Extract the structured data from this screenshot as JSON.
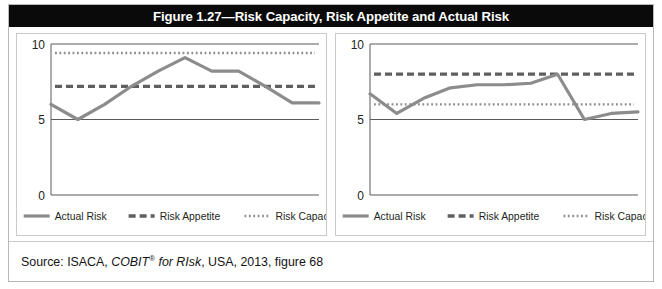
{
  "figure": {
    "title": "Figure 1.27—Risk Capacity, Risk Appetite and Actual Risk",
    "source_prefix": "Source: ISACA, ",
    "source_italic": "COBIT",
    "source_italic_sup": "®",
    "source_italic_tail": " for RIsk",
    "source_suffix": ", USA, 2013, figure 68"
  },
  "style": {
    "title_bg": "#0a0a0a",
    "title_fg": "#ffffff",
    "series_color": "#8c8c8c",
    "axis_color": "#5a5a5a",
    "frame_color": "#c9c9c9",
    "page_bg": "#ffffff"
  },
  "legend": {
    "items": [
      {
        "label": "Actual Risk",
        "style": "solid",
        "color": "#8c8c8c"
      },
      {
        "label": "Risk Appetite",
        "style": "dashed",
        "color": "#5f5f5f"
      },
      {
        "label": "Risk Capacity",
        "style": "dotted",
        "color": "#8c8c8c"
      }
    ]
  },
  "chart_data": [
    {
      "id": "left-chart",
      "type": "line",
      "title": "",
      "xlabel": "",
      "ylabel": "",
      "ylim": [
        0,
        10
      ],
      "yticks": [
        0,
        5,
        10
      ],
      "ytick_labels": [
        "0",
        "5",
        "10"
      ],
      "grid": false,
      "x": [
        0,
        1,
        2,
        3,
        4,
        5,
        6,
        7,
        8,
        9,
        10
      ],
      "series": [
        {
          "name": "Actual Risk",
          "style": "solid",
          "values": [
            6.0,
            5.0,
            6.0,
            7.2,
            8.2,
            9.1,
            8.2,
            8.2,
            7.2,
            6.1,
            6.1
          ]
        },
        {
          "name": "Risk Appetite",
          "style": "dashed",
          "constant": 7.2
        },
        {
          "name": "Risk Capacity",
          "style": "dotted",
          "constant": 9.4
        }
      ]
    },
    {
      "id": "right-chart",
      "type": "line",
      "title": "",
      "xlabel": "",
      "ylabel": "",
      "ylim": [
        0,
        10
      ],
      "yticks": [
        0,
        5,
        10
      ],
      "ytick_labels": [
        "0",
        "5",
        "10"
      ],
      "grid": false,
      "x": [
        0,
        1,
        2,
        3,
        4,
        5,
        6,
        7,
        8,
        9,
        10
      ],
      "series": [
        {
          "name": "Actual Risk",
          "style": "solid",
          "values": [
            6.7,
            5.4,
            6.4,
            7.1,
            7.3,
            7.3,
            7.4,
            8.0,
            5.0,
            5.4,
            5.5
          ]
        },
        {
          "name": "Risk Appetite",
          "style": "dashed",
          "constant": 8.0
        },
        {
          "name": "Risk Capacity",
          "style": "dotted",
          "constant": 6.0
        }
      ]
    }
  ]
}
